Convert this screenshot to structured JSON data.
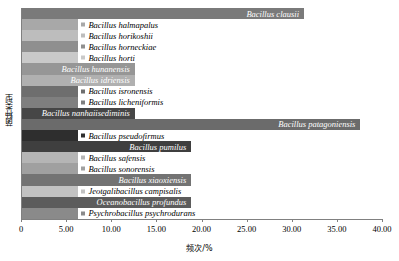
{
  "chart_data": {
    "type": "bar",
    "orientation": "horizontal",
    "title": "",
    "xlabel": "频次/%",
    "ylabel": "菌种类型",
    "xlim": [
      0,
      40
    ],
    "xticks": [
      0,
      5,
      10,
      15,
      20,
      25,
      30,
      35,
      40
    ],
    "xtick_labels": [
      "0",
      "5.00",
      "10.00",
      "15.00",
      "20.00",
      "25.00",
      "30.00",
      "35.00",
      "40.00"
    ],
    "grid": false,
    "legend": "none",
    "categories": [
      "Bacillus clausii",
      "Bacillus halmapalus",
      "Bacillus horikoshii",
      "Bacillus horneckiae",
      "Bacillus horti",
      "Bacillus hunanensis",
      "Bacillus idriensis",
      "Bacillus isronensis",
      "Bacillus licheniformis",
      "Bacillus nanhaiisediminis",
      "Bacillus patagoniensis",
      "Bacillus pseudofirmus",
      "Bacillus pumilus",
      "Bacillus safensis",
      "Bacillus sonorensis",
      "Bacillus xiaoxiensis",
      "Jeotgalibacillus campisalis",
      "Oceanobacillus profundus",
      "Psychrobacillus psychrodurans"
    ],
    "values": [
      31.25,
      6.25,
      6.25,
      6.25,
      6.25,
      12.5,
      12.5,
      6.25,
      6.25,
      12.5,
      37.5,
      6.25,
      18.75,
      6.25,
      6.25,
      18.75,
      6.25,
      18.75,
      6.25
    ],
    "colors": [
      "#7a7a7a",
      "#a8a8a8",
      "#bdbdbd",
      "#8f8f8f",
      "#c9c9c9",
      "#969696",
      "#b0b0b0",
      "#6e6e6e",
      "#7f7f7f",
      "#464646",
      "#6b6b6b",
      "#2e2e2e",
      "#3f3f3f",
      "#b5b5b5",
      "#a0a0a0",
      "#737373",
      "#c2c2c2",
      "#5c5c5c",
      "#8a8a8a"
    ],
    "label_on_bar": [
      true,
      false,
      false,
      false,
      false,
      true,
      true,
      false,
      false,
      true,
      true,
      false,
      true,
      false,
      false,
      true,
      false,
      true,
      false
    ]
  }
}
